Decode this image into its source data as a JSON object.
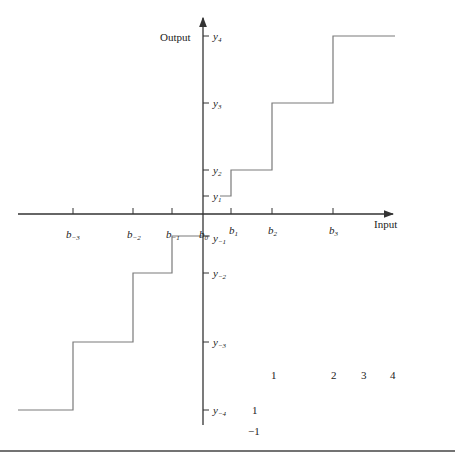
{
  "axes": {
    "x_label": "Input",
    "y_label": "Output"
  },
  "x_ticks": [
    {
      "base": "b",
      "sub": "−3"
    },
    {
      "base": "b",
      "sub": "−2"
    },
    {
      "base": "b",
      "sub": "−1"
    },
    {
      "base": "b",
      "sub": "0"
    },
    {
      "base": "b",
      "sub": "1"
    },
    {
      "base": "b",
      "sub": "2"
    },
    {
      "base": "b",
      "sub": "3"
    }
  ],
  "y_ticks": [
    {
      "base": "y",
      "sub": "4"
    },
    {
      "base": "y",
      "sub": "3"
    },
    {
      "base": "y",
      "sub": "2"
    },
    {
      "base": "y",
      "sub": "1"
    },
    {
      "base": "y",
      "sub": "−1"
    },
    {
      "base": "y",
      "sub": "−2"
    },
    {
      "base": "y",
      "sub": "−3"
    },
    {
      "base": "y",
      "sub": "−4"
    }
  ],
  "stray_numbers": {
    "n1": "1",
    "n2": "2",
    "n3": "3",
    "n4": "4",
    "n5": "1",
    "n6": "−1"
  },
  "colors": {
    "axis": "#333333",
    "staircase": "#7a7a7a",
    "rule": "#444444"
  }
}
